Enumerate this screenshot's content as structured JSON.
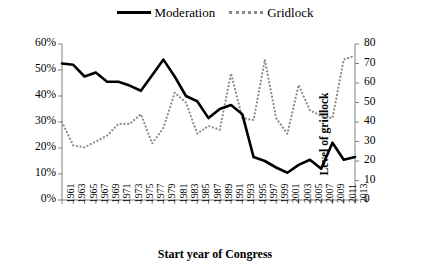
{
  "legend": {
    "entries": [
      {
        "name": "moderation",
        "label": "Moderation",
        "style": "solid",
        "color": "#000000"
      },
      {
        "name": "gridlock",
        "label": "Gridlock",
        "style": "dotted",
        "color": "#8a8a8a"
      }
    ]
  },
  "axes": {
    "left_title": "Share of moderates in the U.S. Congress",
    "right_title": "Level of gridlock",
    "x_title": "Start year of Congress",
    "left_ticks": [
      "0%",
      "10%",
      "20%",
      "30%",
      "40%",
      "50%",
      "60%"
    ],
    "right_ticks": [
      "0",
      "10",
      "20",
      "30",
      "40",
      "50",
      "60",
      "70",
      "80"
    ]
  },
  "chart_data": {
    "type": "line",
    "title": "",
    "xlabel": "Start year of Congress",
    "ylabel": "Share of moderates in the U.S. Congress",
    "y2label": "Level of gridlock",
    "ylim": [
      0,
      60
    ],
    "y2lim": [
      0,
      80
    ],
    "ytick_values": [
      0,
      10,
      20,
      30,
      40,
      50,
      60
    ],
    "y2tick_values": [
      0,
      10,
      20,
      30,
      40,
      50,
      60,
      70,
      80
    ],
    "grid": false,
    "legend_position": "top-center",
    "x": [
      1961,
      1963,
      1965,
      1967,
      1969,
      1971,
      1973,
      1975,
      1977,
      1979,
      1981,
      1983,
      1985,
      1987,
      1989,
      1991,
      1993,
      1995,
      1997,
      1999,
      2001,
      2003,
      2005,
      2007,
      2009,
      2011,
      2013
    ],
    "categories": [
      "1961",
      "1963",
      "1965",
      "1967",
      "1969",
      "1971",
      "1973",
      "1975",
      "1977",
      "1979",
      "1981",
      "1983",
      "1985",
      "1987",
      "1989",
      "1991",
      "1993",
      "1995",
      "1997",
      "1999",
      "2001",
      "2003",
      "2005",
      "2007",
      "2009",
      "2011",
      "2013"
    ],
    "series": [
      {
        "name": "Moderation",
        "axis": "left",
        "style": "solid",
        "color": "#000000",
        "unit": "%",
        "values": [
          52.5,
          52.0,
          47.5,
          49.0,
          45.5,
          45.5,
          44.0,
          42.0,
          48.0,
          54.0,
          47.5,
          40.0,
          38.0,
          31.5,
          35.0,
          36.5,
          33.0,
          16.5,
          15.0,
          12.5,
          10.5,
          13.5,
          15.5,
          12.0,
          22.0,
          15.5,
          16.5
        ]
      },
      {
        "name": "Gridlock",
        "axis": "right",
        "style": "dotted",
        "color": "#8a8a8a",
        "unit": "",
        "values": [
          40,
          28,
          27,
          30,
          33,
          39,
          39,
          44,
          29,
          37,
          55,
          50,
          34,
          38,
          36,
          65,
          42,
          41,
          72,
          42,
          34,
          59,
          46,
          43,
          42,
          72,
          74
        ]
      }
    ]
  }
}
